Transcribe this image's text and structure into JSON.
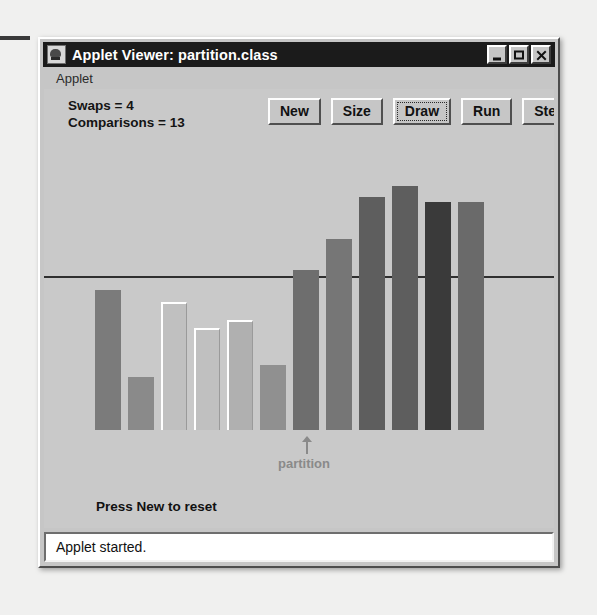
{
  "window": {
    "title": "Applet Viewer: partition.class",
    "icon": "applet-viewer-icon",
    "controls": {
      "minimize": "_",
      "maximize": "□",
      "close": "×"
    }
  },
  "menubar": {
    "items": [
      {
        "label": "Applet"
      }
    ]
  },
  "applet": {
    "stats": {
      "swaps_label": "Swaps = 4",
      "comparisons_label": "Comparisons = 13"
    },
    "buttons": [
      {
        "label": "New",
        "name": "new-button",
        "focused": false
      },
      {
        "label": "Size",
        "name": "size-button",
        "focused": false
      },
      {
        "label": "Draw",
        "name": "draw-button",
        "focused": true
      },
      {
        "label": "Run",
        "name": "run-button",
        "focused": false
      },
      {
        "label": "Step",
        "name": "step-button",
        "focused": false
      }
    ],
    "message": "Press New to reset",
    "partition_label": "partition",
    "colors": {
      "canvas": "#c9c9c9",
      "pivot_line": "#2f2f2f",
      "marker": "#8a8a8a"
    }
  },
  "statusbar": {
    "text": "Applet started."
  },
  "chart_data": {
    "type": "bar",
    "title": "",
    "xlabel": "",
    "ylabel": "",
    "grid": false,
    "legend": null,
    "annotations": [
      {
        "text": "partition",
        "at_bar_index": 6,
        "marker": "up-arrow"
      },
      {
        "text": "pivot line",
        "type": "hline",
        "y": 63
      }
    ],
    "ylim": [
      0,
      100
    ],
    "bar_pitch_px": 33,
    "bar_width_px": 26,
    "baseline_y_px": 428,
    "categories": [
      "1",
      "2",
      "3",
      "4",
      "5",
      "6",
      "7",
      "8",
      "9",
      "10",
      "11",
      "12"
    ],
    "values": [
      58,
      22,
      65,
      47,
      52,
      31,
      68,
      82,
      98,
      105,
      93,
      93
    ],
    "bars": [
      {
        "index": 1,
        "value": 58,
        "top_px": 288,
        "color": "#7b7b7b",
        "outlined": false
      },
      {
        "index": 2,
        "value": 22,
        "top_px": 375,
        "color": "#8a8a8a",
        "outlined": false
      },
      {
        "index": 3,
        "value": 65,
        "top_px": 300,
        "color": "#c0c0c0",
        "outlined": true
      },
      {
        "index": 4,
        "value": 47,
        "top_px": 326,
        "color": "#c0c0c0",
        "outlined": true
      },
      {
        "index": 5,
        "value": 52,
        "top_px": 318,
        "color": "#b0b0b0",
        "outlined": true
      },
      {
        "index": 6,
        "value": 31,
        "top_px": 363,
        "color": "#909090",
        "outlined": false
      },
      {
        "index": 7,
        "value": 68,
        "top_px": 268,
        "color": "#6e6e6e",
        "outlined": false
      },
      {
        "index": 8,
        "value": 82,
        "top_px": 237,
        "color": "#767676",
        "outlined": false
      },
      {
        "index": 9,
        "value": 98,
        "top_px": 195,
        "color": "#5e5e5e",
        "outlined": false
      },
      {
        "index": 10,
        "value": 105,
        "top_px": 184,
        "color": "#5e5e5e",
        "outlined": false
      },
      {
        "index": 11,
        "value": 93,
        "top_px": 200,
        "color": "#3a3a3a",
        "outlined": false
      },
      {
        "index": 12,
        "value": 93,
        "top_px": 200,
        "color": "#6a6a6a",
        "outlined": false
      }
    ]
  }
}
